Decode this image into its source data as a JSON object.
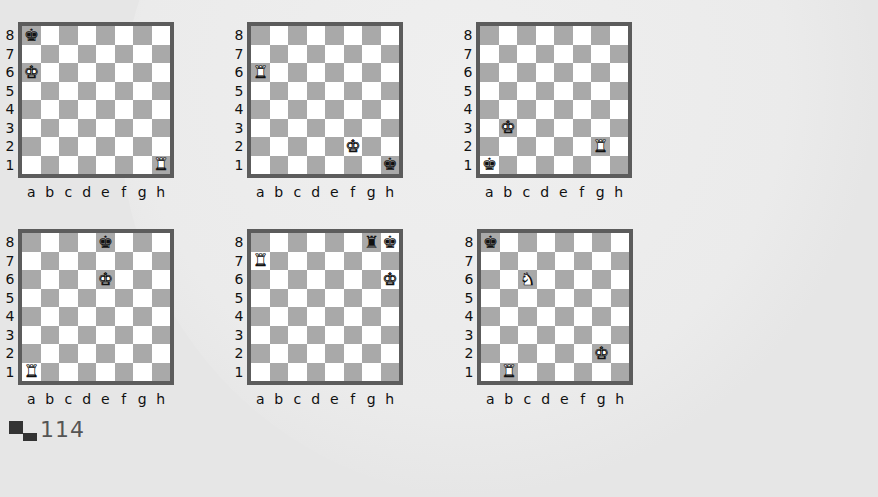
{
  "page_number": "114",
  "files": [
    "a",
    "b",
    "c",
    "d",
    "e",
    "f",
    "g",
    "h"
  ],
  "ranks": [
    "8",
    "7",
    "6",
    "5",
    "4",
    "3",
    "2",
    "1"
  ],
  "colors": {
    "border": "#5c5c5c",
    "dark_square": "#a9a9a9",
    "light_square": "#ffffff",
    "background": "#e6e6e6"
  },
  "diagrams": [
    {
      "id": 1,
      "pieces": [
        {
          "square": "a8",
          "piece": "king",
          "color": "black"
        },
        {
          "square": "a6",
          "piece": "king",
          "color": "white"
        },
        {
          "square": "h1",
          "piece": "rook",
          "color": "white"
        }
      ]
    },
    {
      "id": 2,
      "pieces": [
        {
          "square": "a6",
          "piece": "rook",
          "color": "white"
        },
        {
          "square": "f2",
          "piece": "king",
          "color": "white"
        },
        {
          "square": "h1",
          "piece": "king",
          "color": "black"
        }
      ]
    },
    {
      "id": 3,
      "pieces": [
        {
          "square": "b3",
          "piece": "king",
          "color": "white"
        },
        {
          "square": "g2",
          "piece": "rook",
          "color": "white"
        },
        {
          "square": "a1",
          "piece": "king",
          "color": "black"
        }
      ]
    },
    {
      "id": 4,
      "pieces": [
        {
          "square": "e8",
          "piece": "king",
          "color": "black"
        },
        {
          "square": "e6",
          "piece": "king",
          "color": "white"
        },
        {
          "square": "a1",
          "piece": "rook",
          "color": "white"
        }
      ]
    },
    {
      "id": 5,
      "pieces": [
        {
          "square": "g8",
          "piece": "rook",
          "color": "black"
        },
        {
          "square": "h8",
          "piece": "king",
          "color": "black"
        },
        {
          "square": "a7",
          "piece": "rook",
          "color": "white"
        },
        {
          "square": "h6",
          "piece": "king",
          "color": "white"
        }
      ]
    },
    {
      "id": 6,
      "pieces": [
        {
          "square": "a8",
          "piece": "king",
          "color": "black"
        },
        {
          "square": "c6",
          "piece": "knight",
          "color": "white"
        },
        {
          "square": "g2",
          "piece": "king",
          "color": "white"
        },
        {
          "square": "b1",
          "piece": "rook",
          "color": "white"
        }
      ]
    }
  ],
  "glyphs": {
    "king": "♚",
    "rook": "♜",
    "knight": "♞",
    "bishop": "♝",
    "queen": "♛",
    "pawn": "♟"
  }
}
